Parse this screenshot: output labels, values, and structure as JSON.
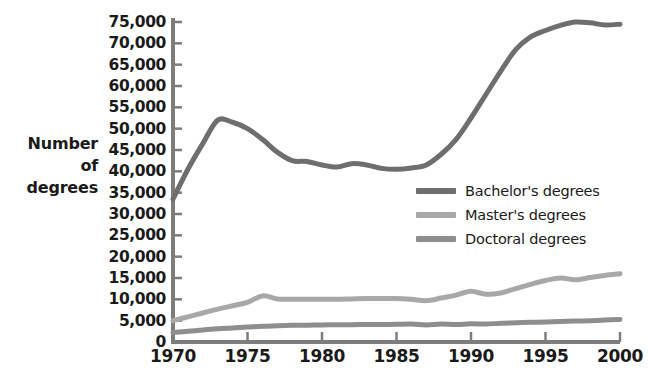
{
  "chart_data": {
    "type": "line",
    "title": "",
    "xlabel": "",
    "ylabel": "Number of degrees",
    "ylabel_lines": [
      "Number",
      "of",
      "degrees"
    ],
    "xlim": [
      1970,
      2000
    ],
    "ylim": [
      0,
      75000
    ],
    "y_tick_step": 5000,
    "grid": false,
    "legend_position": "inside-right",
    "x_tick_labels": [
      "1970",
      "1975",
      "1980",
      "1985",
      "1990",
      "1995",
      "2000"
    ],
    "x_tick_values": [
      1970,
      1975,
      1980,
      1985,
      1990,
      1995,
      2000
    ],
    "y_tick_labels": [
      "75,000",
      "70,000",
      "65,000",
      "60,000",
      "55,000",
      "50,000",
      "45,000",
      "40,000",
      "35,000",
      "30,000",
      "25,000",
      "20,000",
      "15,000",
      "10,000",
      "5,000",
      "0"
    ],
    "y_tick_values": [
      75000,
      70000,
      65000,
      60000,
      55000,
      50000,
      45000,
      40000,
      35000,
      30000,
      25000,
      20000,
      15000,
      10000,
      5000,
      0
    ],
    "x": [
      1970,
      1971,
      1972,
      1973,
      1974,
      1975,
      1976,
      1977,
      1978,
      1979,
      1980,
      1981,
      1982,
      1983,
      1984,
      1985,
      1986,
      1987,
      1988,
      1989,
      1990,
      1991,
      1992,
      1993,
      1994,
      1995,
      1996,
      1997,
      1998,
      1999,
      2000
    ],
    "series": [
      {
        "name": "Bachelor's degrees",
        "color": "#6e6e6e",
        "values": [
          33500,
          40500,
          46500,
          52000,
          51500,
          50000,
          47500,
          44500,
          42500,
          42300,
          41500,
          41000,
          41800,
          41500,
          40700,
          40500,
          40800,
          41500,
          44000,
          47500,
          52500,
          58000,
          63500,
          68500,
          71500,
          73000,
          74200,
          75000,
          74800,
          74300,
          74500
        ]
      },
      {
        "name": "Master's degrees",
        "color": "#a8a8a8",
        "values": [
          5000,
          5900,
          6800,
          7700,
          8500,
          9300,
          10800,
          10100,
          10000,
          10000,
          10000,
          10000,
          10100,
          10200,
          10200,
          10200,
          10000,
          9700,
          10300,
          11000,
          11900,
          11200,
          11500,
          12500,
          13500,
          14400,
          15000,
          14600,
          15100,
          15600,
          16000
        ]
      },
      {
        "name": "Doctoral degrees",
        "color": "#8e8e8e",
        "values": [
          2200,
          2500,
          2800,
          3100,
          3300,
          3500,
          3700,
          3800,
          3900,
          3950,
          4000,
          4050,
          4050,
          4100,
          4100,
          4150,
          4200,
          4000,
          4200,
          4100,
          4250,
          4200,
          4400,
          4500,
          4600,
          4700,
          4800,
          4900,
          5000,
          5150,
          5300
        ]
      }
    ]
  },
  "legend": {
    "items": [
      {
        "label": "Bachelor's degrees",
        "color": "#6e6e6e"
      },
      {
        "label": "Master's degrees",
        "color": "#a8a8a8"
      },
      {
        "label": "Doctoral degrees",
        "color": "#8e8e8e"
      }
    ]
  },
  "axes": {
    "line_color": "#7d7d7d",
    "y_title": "Number of degrees"
  }
}
